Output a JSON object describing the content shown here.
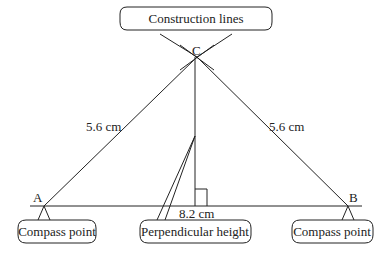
{
  "diagram": {
    "points": {
      "A": {
        "label": "A",
        "x": 44,
        "y": 206
      },
      "B": {
        "label": "B",
        "x": 348,
        "y": 206
      },
      "C": {
        "label": "C",
        "x": 197,
        "y": 57
      }
    },
    "sides": {
      "AC": "5.6 cm",
      "BC": "5.6 cm",
      "AB": "8.2 cm"
    },
    "callouts": {
      "construction": "Construction lines",
      "compass_a": "Compass point",
      "compass_b": "Compass point",
      "perpendicular": "Perpendicular height"
    },
    "colors": {
      "line": "#222222",
      "background": "#ffffff"
    }
  }
}
